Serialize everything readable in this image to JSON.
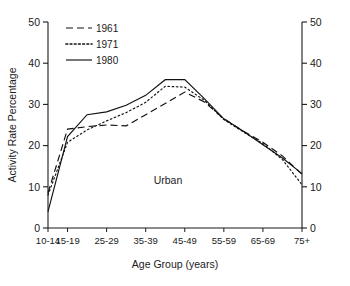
{
  "chart_data": {
    "type": "line",
    "title": "",
    "xlabel": "Age Group (years)",
    "ylabel": "Activity Rate Percentage",
    "ylabel_right": "Activity Rate Percentage",
    "annotation": "Urban",
    "grid": false,
    "legend_position": "top-left",
    "ylim": [
      0,
      50
    ],
    "yticks": [
      0,
      10,
      20,
      30,
      40,
      50
    ],
    "yticklabels": [
      "0",
      "10",
      "20",
      "30",
      "40",
      "50"
    ],
    "yticks_right": [
      0,
      10,
      20,
      30,
      40,
      50
    ],
    "yticklabels_right": [
      "0",
      "10",
      "20",
      "30",
      "40",
      "50"
    ],
    "categories": [
      "10-14",
      "15-19",
      "20-24",
      "25-29",
      "30-34",
      "35-39",
      "40-44",
      "45-49",
      "50-54",
      "55-59",
      "60-64",
      "65-69",
      "70-74",
      "75+"
    ],
    "xticklabels_shown": [
      "10-14",
      "15-19",
      "25-29",
      "35-39",
      "45-49",
      "55-59",
      "65-69",
      "75+"
    ],
    "xticklabel_indices_shown": [
      0,
      1,
      3,
      5,
      7,
      9,
      11,
      13
    ],
    "series": [
      {
        "name": "1961",
        "style": "dashed",
        "color": "#111111",
        "values": [
          8.5,
          24.0,
          24.6,
          25.0,
          24.8,
          27.5,
          30.2,
          33.0,
          30.6,
          26.5,
          23.5,
          20.8,
          17.5,
          13.0
        ]
      },
      {
        "name": "1971",
        "style": "dotted",
        "color": "#111111",
        "values": [
          8.0,
          20.8,
          23.8,
          26.0,
          28.0,
          30.5,
          34.4,
          34.2,
          31.0,
          26.3,
          23.3,
          20.5,
          16.6,
          10.5
        ]
      },
      {
        "name": "1980",
        "style": "solid",
        "color": "#111111",
        "values": [
          4.0,
          22.2,
          27.5,
          28.2,
          29.8,
          32.2,
          36.0,
          36.0,
          31.4,
          26.5,
          23.5,
          20.2,
          17.0,
          13.2
        ]
      }
    ]
  },
  "legend": {
    "entries": [
      {
        "label": "1961",
        "style": "dashed"
      },
      {
        "label": "1971",
        "style": "dotted"
      },
      {
        "label": "1980",
        "style": "solid"
      }
    ]
  }
}
